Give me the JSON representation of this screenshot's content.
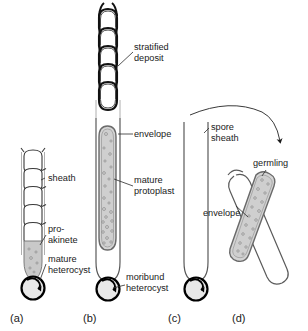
{
  "figure": {
    "background_color": "#ffffff",
    "width": 308,
    "height": 331,
    "colors": {
      "line": "#3a3a3a",
      "heavy_line": "#000000",
      "protoplast_fill": "#d2d2d2",
      "akinete_fill": "#c9c9c9",
      "heterocyst_fill": "#e3e3e3",
      "envelope_fill": "#bdbdbd",
      "text": "#1a1a1a",
      "sheath_line": "#9a9a9a"
    }
  },
  "panels": [
    {
      "id": "a",
      "label": "(a)",
      "label_x": 10,
      "label_y": 322,
      "description": "Vegetative filament with sheath, a developing pro-akinete and a mature heterocyst at the base"
    },
    {
      "id": "b",
      "label": "(b)",
      "label_x": 83,
      "label_y": 322,
      "description": "Mature akinete with stratified deposit cells, envelope, mature protoplast and moribund heterocyst"
    },
    {
      "id": "c",
      "label": "(c)",
      "label_x": 168,
      "label_y": 322,
      "description": "Empty spore sheath remaining after germination, with moribund heterocyst"
    },
    {
      "id": "d",
      "label": "(d)",
      "label_x": 232,
      "label_y": 322,
      "description": "Germling emerging from the envelope at an angle"
    }
  ],
  "labels": [
    {
      "id": "stratified-deposit",
      "lines": [
        "stratified",
        "deposit"
      ],
      "x": 134,
      "y": 50,
      "anchor": "start",
      "panel": "b"
    },
    {
      "id": "envelope-b",
      "lines": [
        "envelope"
      ],
      "x": 134,
      "y": 137,
      "anchor": "start",
      "panel": "b"
    },
    {
      "id": "mature-protoplast",
      "lines": [
        "mature",
        "protoplast"
      ],
      "x": 134,
      "y": 183,
      "anchor": "start",
      "panel": "b"
    },
    {
      "id": "moribund-heterocyst",
      "lines": [
        "moribund",
        "heterocyst"
      ],
      "x": 126,
      "y": 280,
      "anchor": "start",
      "panel": "b"
    },
    {
      "id": "sheath",
      "lines": [
        "sheath"
      ],
      "x": 48,
      "y": 181,
      "anchor": "start",
      "panel": "a"
    },
    {
      "id": "pro-akinete",
      "lines": [
        "pro-",
        "akinete"
      ],
      "x": 48,
      "y": 232,
      "anchor": "start",
      "panel": "a"
    },
    {
      "id": "mature-heterocyst",
      "lines": [
        "mature",
        "heterocyst"
      ],
      "x": 48,
      "y": 262,
      "anchor": "start",
      "panel": "a"
    },
    {
      "id": "spore-sheath",
      "lines": [
        "spore",
        "sheath"
      ],
      "x": 211,
      "y": 130,
      "anchor": "start",
      "panel": "c"
    },
    {
      "id": "germling",
      "lines": [
        "germling"
      ],
      "x": 253,
      "y": 166,
      "anchor": "start",
      "panel": "d"
    },
    {
      "id": "envelope-d",
      "lines": [
        "envelope"
      ],
      "x": 203,
      "y": 216,
      "anchor": "start",
      "panel": "d"
    }
  ],
  "annotations": {
    "germination_arrow": {
      "id": "germination-arrow",
      "description": "Curved arrow from panel (c) sweeping right and down into panel (d)",
      "from_panel": "c",
      "to_panel": "d"
    }
  },
  "structures": {
    "a": {
      "vegetative_cells": 5,
      "pro_akinete": 1,
      "heterocyst": 1
    },
    "b": {
      "stratified_deposit_cells": 5,
      "protoplast_granules": 34,
      "heterocyst": 1
    },
    "c": {
      "empty_sheath": 1,
      "heterocyst": 1
    },
    "d": {
      "germling": 1,
      "envelope": 1,
      "granules": 18
    }
  }
}
